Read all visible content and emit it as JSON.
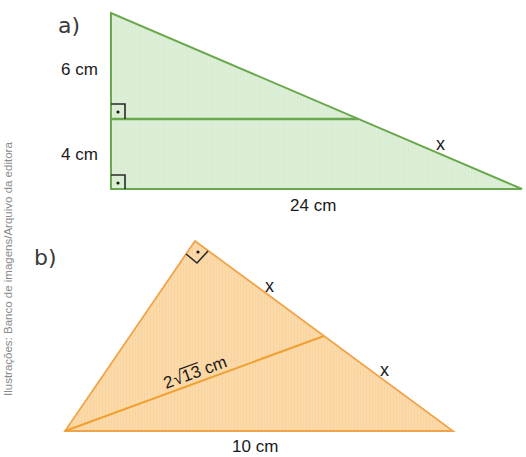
{
  "credit": "Ilustrações: Banco de imagens/Arquivo da editora",
  "figure_a": {
    "label": "a)",
    "colors": {
      "fill": "#dcefd6",
      "stroke": "#6aa84f"
    },
    "labels": {
      "upper_leg": "6 cm",
      "lower_leg": "4 cm",
      "base": "24 cm",
      "hypotenuse": "x"
    },
    "right_angle_marks": 2
  },
  "figure_b": {
    "label": "b)",
    "colors": {
      "fill": "#fcd7a4",
      "stroke": "#f0a44a"
    },
    "labels": {
      "upper_side": "x",
      "lower_side": "x",
      "median": "2√13 cm",
      "median_prefix": "2",
      "median_radicand": "13",
      "median_unit": " cm",
      "base": "10 cm"
    },
    "right_angle_marks": 1
  }
}
